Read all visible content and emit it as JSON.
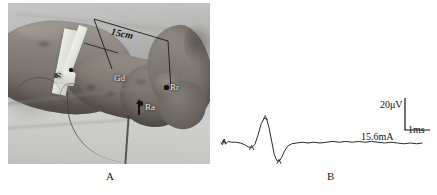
{
  "figure": {
    "panels": [
      {
        "id": "A",
        "caption": "A",
        "type": "photograph",
        "description": "leg-ankle-electrode-placement-photo",
        "annotations": {
          "distance_label": "15cm",
          "stimulator_label": "S",
          "ground_label": "Gd",
          "active_recording_label": "Ra",
          "reference_recording_label": "Rr"
        }
      },
      {
        "id": "B",
        "caption": "B",
        "type": "waveform",
        "scale": {
          "amplitude": "20μV",
          "time": "1ms"
        },
        "stimulus_intensity": "15.6mA"
      }
    ]
  },
  "chart_data": {
    "type": "line",
    "title": "",
    "xlabel": "Time",
    "ylabel": "Amplitude",
    "scale_bars": {
      "amplitude_label": "20μV",
      "amplitude_value": 20,
      "amplitude_unit": "μV",
      "time_label": "1ms",
      "time_value": 1,
      "time_unit": "ms"
    },
    "annotations": [
      {
        "text": "15.6mA",
        "role": "stimulus-intensity"
      }
    ],
    "grid": false,
    "legend": null,
    "series": [
      {
        "name": "sensory-nerve-action-potential",
        "points": [
          [
            0,
            0
          ],
          [
            2,
            -2
          ],
          [
            4,
            5
          ],
          [
            6,
            -1
          ],
          [
            9,
            2
          ],
          [
            13,
            1
          ],
          [
            18,
            1
          ],
          [
            24,
            0
          ],
          [
            29,
            -2
          ],
          [
            34,
            -5
          ],
          [
            38,
            -6
          ],
          [
            42,
            -2
          ],
          [
            46,
            10
          ],
          [
            50,
            25
          ],
          [
            54,
            32
          ],
          [
            57,
            30
          ],
          [
            60,
            18
          ],
          [
            63,
            2
          ],
          [
            66,
            -14
          ],
          [
            69,
            -22
          ],
          [
            72,
            -24
          ],
          [
            75,
            -19
          ],
          [
            79,
            -10
          ],
          [
            83,
            -4
          ],
          [
            88,
            -1
          ],
          [
            94,
            0
          ],
          [
            101,
            1
          ],
          [
            108,
            0
          ],
          [
            115,
            1
          ],
          [
            123,
            0
          ],
          [
            131,
            1
          ],
          [
            139,
            2
          ],
          [
            147,
            1
          ],
          [
            155,
            2
          ],
          [
            163,
            1
          ],
          [
            171,
            2
          ],
          [
            179,
            1
          ],
          [
            187,
            2
          ],
          [
            195,
            1
          ],
          [
            203,
            0
          ],
          [
            211,
            1
          ],
          [
            219,
            0
          ],
          [
            227,
            -1
          ],
          [
            235,
            0
          ],
          [
            243,
            -1
          ],
          [
            250,
            0
          ]
        ]
      }
    ],
    "markers": [
      {
        "x": 3,
        "y": 1,
        "role": "stimulus-artifact"
      },
      {
        "x": 38,
        "y": -6,
        "role": "onset"
      },
      {
        "x": 55,
        "y": 32,
        "role": "positive-peak"
      },
      {
        "x": 72,
        "y": -24,
        "role": "negative-peak"
      }
    ]
  }
}
